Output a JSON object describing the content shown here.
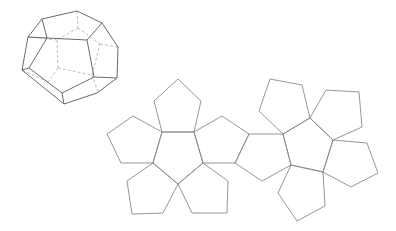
{
  "figure": {
    "title": "",
    "colors": {
      "background": "#ffffff",
      "solid_edge": "#5a5a5a",
      "net_edge": "#8a8a8a",
      "hidden_edge": "#b0b0b0"
    }
  },
  "dodecahedron": {
    "outline": "42,19 77,11 102,23 118,47 117,78 97,93 64,104 22,70 28,37",
    "front_face": "47,38 87,40 94,77 62,93 29,68",
    "visible_edges": [
      "42,19 47,38",
      "102,23 87,40",
      "28,37 47,38",
      "94,77 117,78",
      "62,93 64,104",
      "29,68 22,70"
    ],
    "hidden_edges": [
      "77,11 78,28",
      "78,28 57,40",
      "78,28 100,44",
      "100,44 118,47",
      "57,40 28,37",
      "57,40 58,68",
      "58,68 92,75",
      "92,75 100,44",
      "92,75 98,92",
      "58,68 48,82",
      "48,82 22,70"
    ]
  },
  "net": {
    "faces": [
      {
        "id": "left-center",
        "points": "162,132 194,132 203,163 178,184 153,163"
      },
      {
        "id": "left-top",
        "points": "162,132 194,132 201,101 178,79 154,101"
      },
      {
        "id": "left-left",
        "points": "162,132 153,163 121,163 107,134 133,116"
      },
      {
        "id": "left-right",
        "points": "194,132 203,163 235,163 249,134 222,116"
      },
      {
        "id": "left-bottom-left",
        "points": "153,163 178,184 163,213 132,214 127,181"
      },
      {
        "id": "left-bottom-right",
        "points": "178,184 203,163 228,181 227,213 192,213"
      },
      {
        "id": "bridge",
        "points": "249,134 283,134 291,165 262,181 235,163"
      },
      {
        "id": "right-center",
        "points": "283,134 310,118 333,140 323,172 291,165"
      },
      {
        "id": "right-top-left",
        "points": "283,134 310,118 302,85 270,79 259,111"
      },
      {
        "id": "right-top-right",
        "points": "310,118 333,140 362,127 359,92 326,90"
      },
      {
        "id": "right-right",
        "points": "333,140 323,172 351,187 378,173 367,143"
      },
      {
        "id": "right-bottom",
        "points": "323,172 291,165 278,193 297,221 325,206"
      }
    ]
  }
}
